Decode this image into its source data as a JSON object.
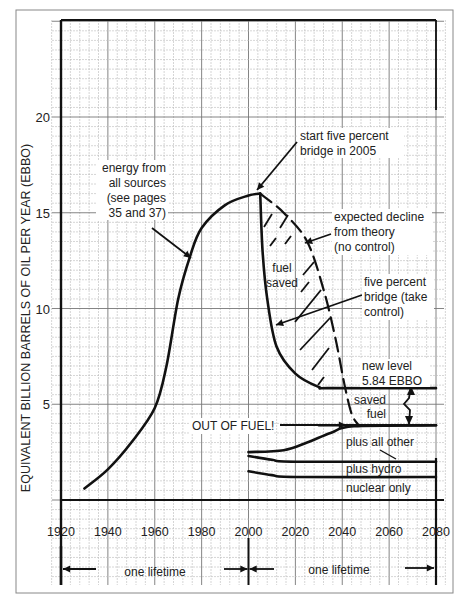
{
  "chart_data": {
    "type": "line",
    "title": "",
    "xlabel": "",
    "ylabel": "EQUIVALENT BILLION BARRELS OF OIL PER YEAR (EBBO)",
    "xlim": [
      1920,
      2080
    ],
    "ylim": [
      0,
      25
    ],
    "grid": true,
    "x_ticks": [
      "1920",
      "1940",
      "1960",
      "1980",
      "2000",
      "2020",
      "2040",
      "2060",
      "2080"
    ],
    "y_ticks": [
      "5",
      "10",
      "15",
      "20"
    ],
    "series": [
      {
        "name": "energy from all sources",
        "style": "solid",
        "points": [
          [
            1930,
            0.6
          ],
          [
            1940,
            1.6
          ],
          [
            1950,
            3.0
          ],
          [
            1960,
            4.8
          ],
          [
            1965,
            7.0
          ],
          [
            1970,
            10.5
          ],
          [
            1975,
            12.7
          ],
          [
            1980,
            14.2
          ],
          [
            1990,
            15.4
          ],
          [
            2000,
            15.9
          ],
          [
            2005,
            16.0
          ]
        ]
      },
      {
        "name": "five percent bridge (take control)",
        "style": "solid",
        "points": [
          [
            2005,
            16.0
          ],
          [
            2006,
            13.0
          ],
          [
            2008,
            10.5
          ],
          [
            2012,
            8.0
          ],
          [
            2020,
            6.6
          ],
          [
            2030,
            5.9
          ],
          [
            2035,
            5.84
          ],
          [
            2080,
            5.84
          ]
        ]
      },
      {
        "name": "expected decline from theory (no control)",
        "style": "dashed",
        "points": [
          [
            2005,
            16.0
          ],
          [
            2015,
            15.0
          ],
          [
            2025,
            13.5
          ],
          [
            2032,
            11.0
          ],
          [
            2037,
            8.5
          ],
          [
            2041,
            6.0
          ],
          [
            2044,
            4.5
          ],
          [
            2047,
            3.9
          ]
        ]
      },
      {
        "name": "plus all other",
        "style": "solid",
        "points": [
          [
            2000,
            2.5
          ],
          [
            2015,
            2.6
          ],
          [
            2025,
            3.0
          ],
          [
            2035,
            3.5
          ],
          [
            2045,
            3.85
          ],
          [
            2080,
            3.9
          ]
        ]
      },
      {
        "name": "plus hydro",
        "style": "solid",
        "points": [
          [
            2000,
            2.3
          ],
          [
            2010,
            2.1
          ],
          [
            2020,
            2.0
          ],
          [
            2080,
            2.0
          ]
        ]
      },
      {
        "name": "nuclear only",
        "style": "solid",
        "points": [
          [
            2000,
            1.5
          ],
          [
            2010,
            1.3
          ],
          [
            2020,
            1.2
          ],
          [
            2080,
            1.2
          ]
        ]
      },
      {
        "name": "out of fuel level",
        "style": "solid",
        "points": [
          [
            2030,
            3.9
          ],
          [
            2080,
            3.9
          ]
        ]
      }
    ],
    "annotations": [
      {
        "text": "start five percent bridge in 2005",
        "x": 2005,
        "y": 16.0
      },
      {
        "text": "energy from all sources (see pages 35 and 37)",
        "x": 1975,
        "y": 12.7
      },
      {
        "text": "expected decline from theory (no control)"
      },
      {
        "text": "fuel saved"
      },
      {
        "text": "five percent bridge (take control)"
      },
      {
        "text": "new level 5.84 EBBO",
        "y": 5.84
      },
      {
        "text": "saved fuel"
      },
      {
        "text": "OUT OF FUEL!",
        "y": 3.9
      },
      {
        "text": "plus all other"
      },
      {
        "text": "plus hydro"
      },
      {
        "text": "nuclear only"
      },
      {
        "text": "one lifetime",
        "x_range": [
          1920,
          2000
        ]
      },
      {
        "text": "one lifetime",
        "x_range": [
          2000,
          2080
        ]
      }
    ]
  },
  "labels": {
    "y_axis": "EQUIVALENT BILLION BARRELS OF OIL PER YEAR (EBBO)",
    "energy_1": "energy from",
    "energy_2": "all sources",
    "energy_3": "(see pages",
    "energy_4": "35 and 37)",
    "bridge_start_1": "start five percent",
    "bridge_start_2": "bridge in 2005",
    "decline_1": "expected decline",
    "decline_2": "from theory",
    "decline_3": "(no control)",
    "fuel_saved_1": "fuel",
    "fuel_saved_2": "saved",
    "bridge_1": "five percent",
    "bridge_2": "bridge (take",
    "bridge_3": "control)",
    "new_level_1": "new level",
    "new_level_2": "5.84 EBBO",
    "saved_fuel_1": "saved",
    "saved_fuel_2": "fuel",
    "out_of_fuel": "OUT OF FUEL!",
    "plus_all_other": "plus all other",
    "plus_hydro": "plus hydro",
    "nuclear_only": "nuclear only",
    "lifetime_1": "one lifetime",
    "lifetime_2": "one lifetime"
  }
}
